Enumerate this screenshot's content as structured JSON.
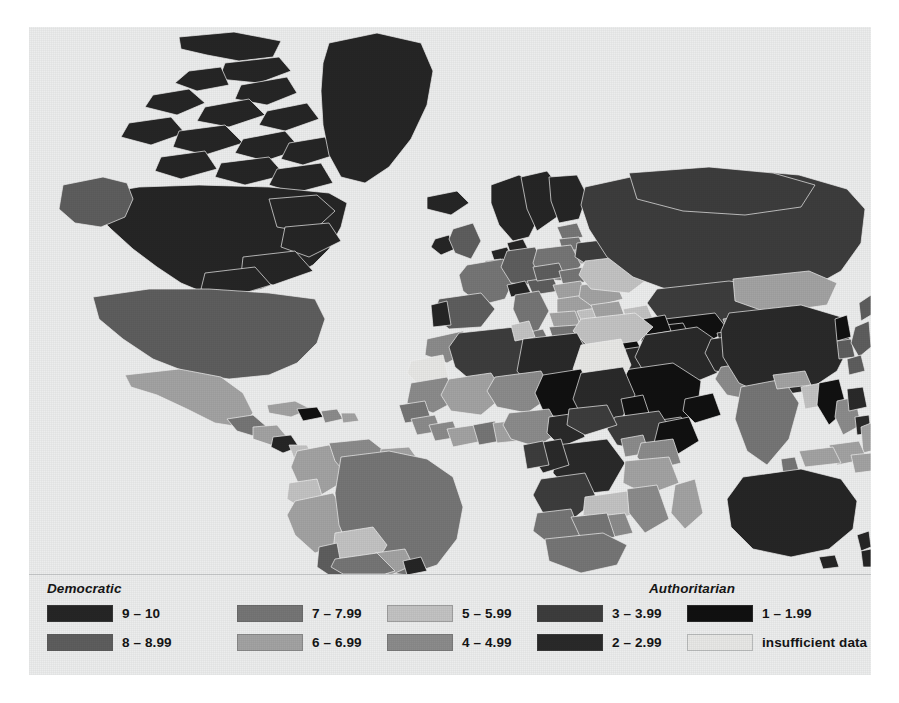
{
  "figure": {
    "kind": "choropleth-world-map",
    "background_color": "#eceded",
    "ocean_color": "#eceded",
    "country_border_color": "#f2f2f2"
  },
  "legend": {
    "heading_left": "Democratic",
    "heading_right": "Authoritarian",
    "columns": [
      {
        "items": [
          {
            "label": "9 – 10",
            "color": "#262626"
          },
          {
            "label": "8 – 8.99",
            "color": "#5e5e5e"
          }
        ]
      },
      {
        "items": [
          {
            "label": "7 – 7.99",
            "color": "#767676"
          },
          {
            "label": "6 – 6.99",
            "color": "#a3a3a3"
          }
        ]
      },
      {
        "items": [
          {
            "label": "5 – 5.99",
            "color": "#c3c3c3"
          },
          {
            "label": "4 – 4.99",
            "color": "#8c8c8c"
          }
        ]
      },
      {
        "items": [
          {
            "label": "3 – 3.99",
            "color": "#3d3d3d"
          },
          {
            "label": "2 – 2.99",
            "color": "#2a2a2a"
          }
        ]
      },
      {
        "items": [
          {
            "label": "1 – 1.99",
            "color": "#111111"
          },
          {
            "label": "insufficient data",
            "color": "#e8e8e6"
          }
        ]
      }
    ]
  },
  "chart_data": {
    "type": "map",
    "title": "",
    "subtitle": "",
    "xlabel": "",
    "ylabel": "",
    "map_projection": "equirectangular-world",
    "scale_name": "Democracy Index score",
    "scale_min": 1,
    "scale_max": 10,
    "legend_position": "bottom",
    "grid": false,
    "bins": [
      {
        "range": "9 – 10",
        "min": 9,
        "max": 10,
        "color": "#262626",
        "group": "Democratic"
      },
      {
        "range": "8 – 8.99",
        "min": 8,
        "max": 8.99,
        "color": "#5e5e5e",
        "group": "Democratic"
      },
      {
        "range": "7 – 7.99",
        "min": 7,
        "max": 7.99,
        "color": "#767676",
        "group": "Democratic"
      },
      {
        "range": "6 – 6.99",
        "min": 6,
        "max": 6.99,
        "color": "#a3a3a3",
        "group": "Democratic"
      },
      {
        "range": "5 – 5.99",
        "min": 5,
        "max": 5.99,
        "color": "#c3c3c3",
        "group": "Democratic"
      },
      {
        "range": "4 – 4.99",
        "min": 4,
        "max": 4.99,
        "color": "#8c8c8c",
        "group": "Authoritarian"
      },
      {
        "range": "3 – 3.99",
        "min": 3,
        "max": 3.99,
        "color": "#3d3d3d",
        "group": "Authoritarian"
      },
      {
        "range": "2 – 2.99",
        "min": 2,
        "max": 2.99,
        "color": "#2a2a2a",
        "group": "Authoritarian"
      },
      {
        "range": "1 – 1.99",
        "min": 1,
        "max": 1.99,
        "color": "#111111",
        "group": "Authoritarian"
      },
      {
        "range": "insufficient data",
        "min": null,
        "max": null,
        "color": "#e8e8e6",
        "group": ""
      }
    ],
    "regions": [
      {
        "name": "Canada",
        "bin": "9 – 10"
      },
      {
        "name": "Greenland",
        "bin": "9 – 10"
      },
      {
        "name": "Iceland",
        "bin": "9 – 10"
      },
      {
        "name": "Norway",
        "bin": "9 – 10"
      },
      {
        "name": "Sweden",
        "bin": "9 – 10"
      },
      {
        "name": "Finland",
        "bin": "9 – 10"
      },
      {
        "name": "Denmark",
        "bin": "9 – 10"
      },
      {
        "name": "Ireland",
        "bin": "9 – 10"
      },
      {
        "name": "Netherlands",
        "bin": "9 – 10"
      },
      {
        "name": "Switzerland",
        "bin": "9 – 10"
      },
      {
        "name": "Australia",
        "bin": "9 – 10"
      },
      {
        "name": "New Zealand",
        "bin": "9 – 10"
      },
      {
        "name": "Uruguay",
        "bin": "9 – 10"
      },
      {
        "name": "United States",
        "bin": "8 – 8.99"
      },
      {
        "name": "United Kingdom",
        "bin": "8 – 8.99"
      },
      {
        "name": "Germany",
        "bin": "8 – 8.99"
      },
      {
        "name": "Spain",
        "bin": "8 – 8.99"
      },
      {
        "name": "Portugal",
        "bin": "8 – 8.99"
      },
      {
        "name": "Czechia",
        "bin": "8 – 8.99"
      },
      {
        "name": "Japan",
        "bin": "8 – 8.99"
      },
      {
        "name": "South Korea",
        "bin": "8 – 8.99"
      },
      {
        "name": "Chile",
        "bin": "8 – 8.99"
      },
      {
        "name": "Costa Rica",
        "bin": "8 – 8.99"
      },
      {
        "name": "France",
        "bin": "7 – 7.99"
      },
      {
        "name": "Italy",
        "bin": "7 – 7.99"
      },
      {
        "name": "Poland",
        "bin": "7 – 7.99"
      },
      {
        "name": "Brazil",
        "bin": "7 – 7.99"
      },
      {
        "name": "Argentina",
        "bin": "7 – 7.99"
      },
      {
        "name": "India",
        "bin": "7 – 7.99"
      },
      {
        "name": "South Africa",
        "bin": "7 – 7.99"
      },
      {
        "name": "Mexico",
        "bin": "6 – 6.99"
      },
      {
        "name": "Colombia",
        "bin": "6 – 6.99"
      },
      {
        "name": "Peru",
        "bin": "6 – 6.99"
      },
      {
        "name": "Indonesia",
        "bin": "6 – 6.99"
      },
      {
        "name": "Mongolia",
        "bin": "6 – 6.99"
      },
      {
        "name": "Ukraine",
        "bin": "5 – 5.99"
      },
      {
        "name": "Turkey",
        "bin": "5 – 5.99"
      },
      {
        "name": "Bolivia",
        "bin": "5 – 5.99"
      },
      {
        "name": "Ecuador",
        "bin": "5 – 5.99"
      },
      {
        "name": "Bangladesh",
        "bin": "5 – 5.99"
      },
      {
        "name": "Thailand",
        "bin": "4 – 4.99"
      },
      {
        "name": "Pakistan",
        "bin": "4 – 4.99"
      },
      {
        "name": "Nigeria",
        "bin": "4 – 4.99"
      },
      {
        "name": "Kenya",
        "bin": "4 – 4.99"
      },
      {
        "name": "Venezuela",
        "bin": "4 – 4.99"
      },
      {
        "name": "Russia",
        "bin": "3 – 3.99"
      },
      {
        "name": "Egypt",
        "bin": "3 – 3.99"
      },
      {
        "name": "Algeria",
        "bin": "3 – 3.99"
      },
      {
        "name": "Angola",
        "bin": "3 – 3.99"
      },
      {
        "name": "Kazakhstan",
        "bin": "3 – 3.99"
      },
      {
        "name": "China",
        "bin": "2 – 2.99"
      },
      {
        "name": "Iran",
        "bin": "2 – 2.99"
      },
      {
        "name": "Afghanistan",
        "bin": "2 – 2.99"
      },
      {
        "name": "Libya",
        "bin": "2 – 2.99"
      },
      {
        "name": "Sudan",
        "bin": "2 – 2.99"
      },
      {
        "name": "Saudi Arabia",
        "bin": "1 – 1.99"
      },
      {
        "name": "North Korea",
        "bin": "1 – 1.99"
      },
      {
        "name": "Uzbekistan",
        "bin": "1 – 1.99"
      },
      {
        "name": "Turkmenistan",
        "bin": "1 – 1.99"
      },
      {
        "name": "Chad",
        "bin": "1 – 1.99"
      },
      {
        "name": "Antarctica",
        "bin": "insufficient data"
      },
      {
        "name": "Western Sahara",
        "bin": "insufficient data"
      }
    ]
  }
}
